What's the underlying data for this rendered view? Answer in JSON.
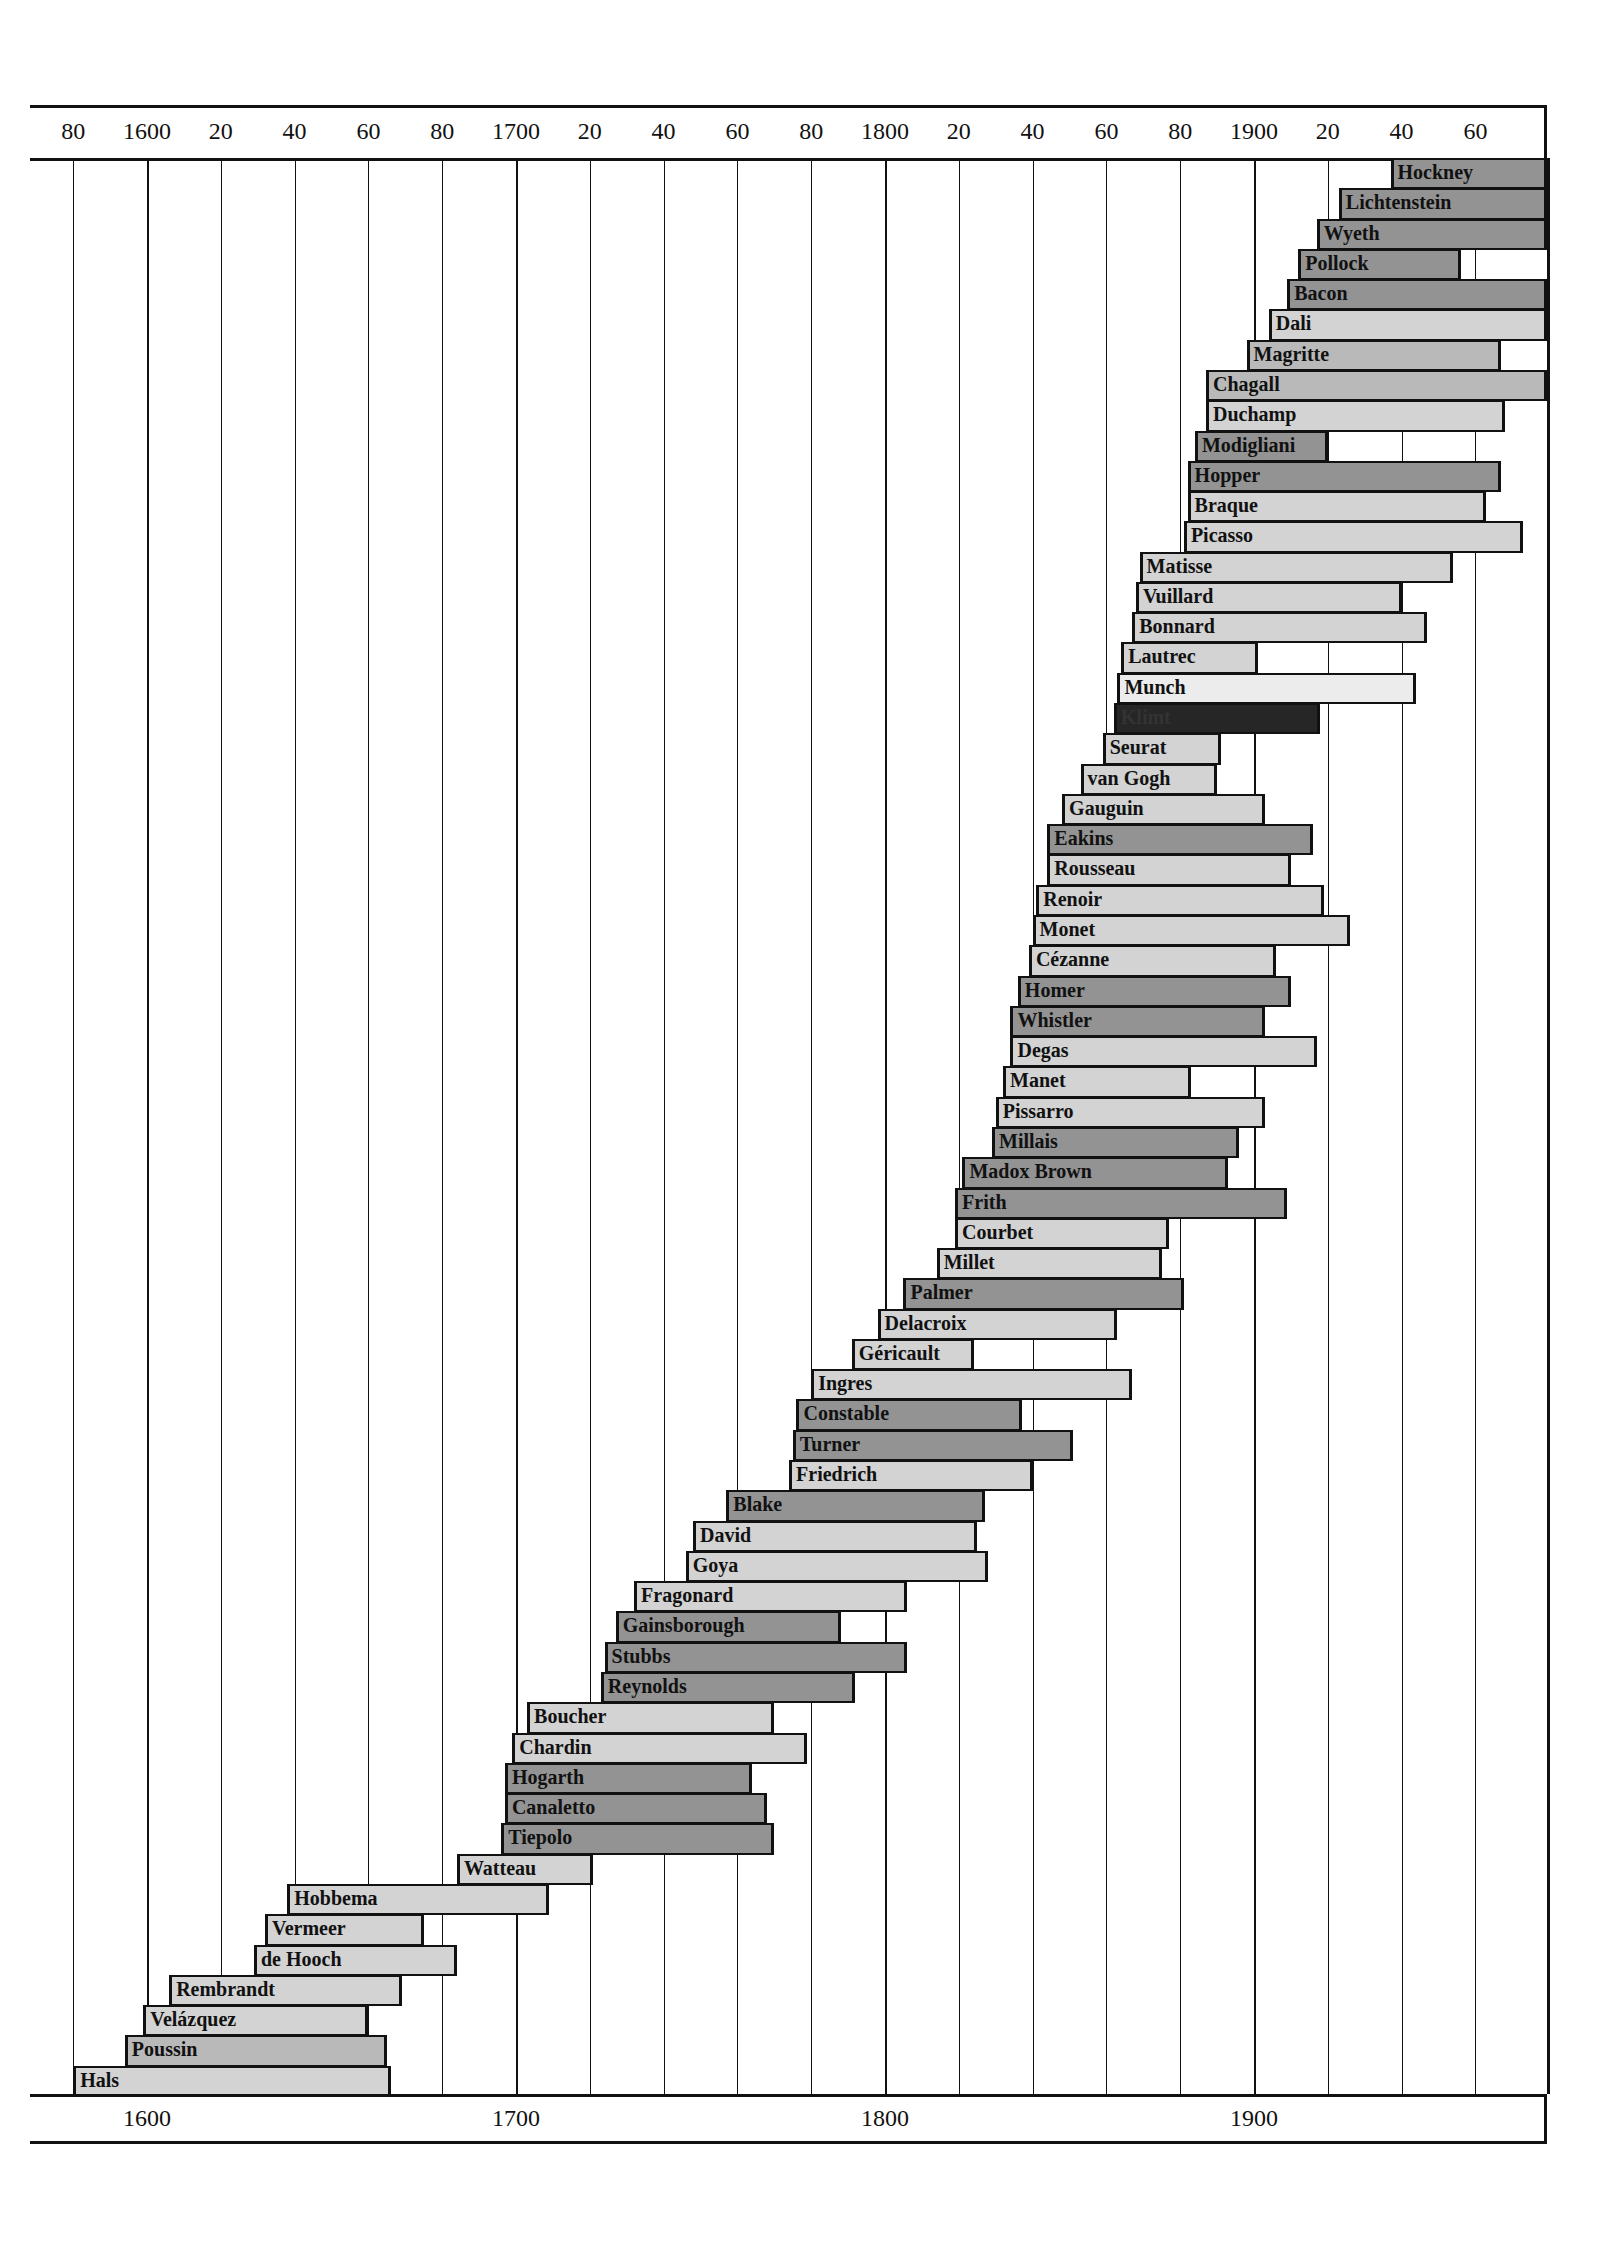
{
  "chart_data": {
    "type": "bar",
    "subtype": "timeline-gantt",
    "title": "",
    "xlabel": "Year",
    "ylabel": "",
    "xlim": [
      1568,
      1979
    ],
    "grid": true,
    "grid_interval_years": 20,
    "legend": null,
    "top_axis_ticks": [
      "80",
      "1600",
      "20",
      "40",
      "60",
      "80",
      "1700",
      "20",
      "40",
      "60",
      "80",
      "1800",
      "20",
      "40",
      "60",
      "80",
      "1900",
      "20",
      "40",
      "60"
    ],
    "top_axis_tick_years": [
      1580,
      1600,
      1620,
      1640,
      1660,
      1680,
      1700,
      1720,
      1740,
      1760,
      1780,
      1800,
      1820,
      1840,
      1860,
      1880,
      1900,
      1920,
      1940,
      1960
    ],
    "bottom_axis_ticks": [
      "1600",
      "1700",
      "1800",
      "1900"
    ],
    "bottom_axis_tick_years": [
      1600,
      1700,
      1800,
      1900
    ],
    "note": "Bars extending to right frame edge denote artists still living at publication.",
    "series": [
      {
        "name": "Hockney",
        "start": 1937,
        "end": null,
        "shade": "dark"
      },
      {
        "name": "Lichtenstein",
        "start": 1923,
        "end": null,
        "shade": "dark"
      },
      {
        "name": "Wyeth",
        "start": 1917,
        "end": null,
        "shade": "dark"
      },
      {
        "name": "Pollock",
        "start": 1912,
        "end": 1956,
        "shade": "dark"
      },
      {
        "name": "Bacon",
        "start": 1909,
        "end": null,
        "shade": "dark"
      },
      {
        "name": "Dali",
        "start": 1904,
        "end": null,
        "shade": "light"
      },
      {
        "name": "Magritte",
        "start": 1898,
        "end": 1967,
        "shade": "mid"
      },
      {
        "name": "Chagall",
        "start": 1887,
        "end": null,
        "shade": "mid"
      },
      {
        "name": "Duchamp",
        "start": 1887,
        "end": 1968,
        "shade": "light"
      },
      {
        "name": "Modigliani",
        "start": 1884,
        "end": 1920,
        "shade": "dark"
      },
      {
        "name": "Hopper",
        "start": 1882,
        "end": 1967,
        "shade": "dark"
      },
      {
        "name": "Braque",
        "start": 1882,
        "end": 1963,
        "shade": "light"
      },
      {
        "name": "Picasso",
        "start": 1881,
        "end": 1973,
        "shade": "light"
      },
      {
        "name": "Matisse",
        "start": 1869,
        "end": 1954,
        "shade": "light"
      },
      {
        "name": "Vuillard",
        "start": 1868,
        "end": 1940,
        "shade": "light"
      },
      {
        "name": "Bonnard",
        "start": 1867,
        "end": 1947,
        "shade": "light"
      },
      {
        "name": "Lautrec",
        "start": 1864,
        "end": 1901,
        "shade": "light"
      },
      {
        "name": "Munch",
        "start": 1863,
        "end": 1944,
        "shade": "vlight"
      },
      {
        "name": "Klimt",
        "start": 1862,
        "end": 1918,
        "shade": "black"
      },
      {
        "name": "Seurat",
        "start": 1859,
        "end": 1891,
        "shade": "light"
      },
      {
        "name": "van Gogh",
        "start": 1853,
        "end": 1890,
        "shade": "light"
      },
      {
        "name": "Gauguin",
        "start": 1848,
        "end": 1903,
        "shade": "light"
      },
      {
        "name": "Eakins",
        "start": 1844,
        "end": 1916,
        "shade": "dark"
      },
      {
        "name": "Rousseau",
        "start": 1844,
        "end": 1910,
        "shade": "light"
      },
      {
        "name": "Renoir",
        "start": 1841,
        "end": 1919,
        "shade": "light"
      },
      {
        "name": "Monet",
        "start": 1840,
        "end": 1926,
        "shade": "light"
      },
      {
        "name": "Cézanne",
        "start": 1839,
        "end": 1906,
        "shade": "light"
      },
      {
        "name": "Homer",
        "start": 1836,
        "end": 1910,
        "shade": "dark"
      },
      {
        "name": "Whistler",
        "start": 1834,
        "end": 1903,
        "shade": "dark"
      },
      {
        "name": "Degas",
        "start": 1834,
        "end": 1917,
        "shade": "light"
      },
      {
        "name": "Manet",
        "start": 1832,
        "end": 1883,
        "shade": "light"
      },
      {
        "name": "Pissarro",
        "start": 1830,
        "end": 1903,
        "shade": "light"
      },
      {
        "name": "Millais",
        "start": 1829,
        "end": 1896,
        "shade": "dark"
      },
      {
        "name": "Madox Brown",
        "start": 1821,
        "end": 1893,
        "shade": "dark"
      },
      {
        "name": "Frith",
        "start": 1819,
        "end": 1909,
        "shade": "dark"
      },
      {
        "name": "Courbet",
        "start": 1819,
        "end": 1877,
        "shade": "light"
      },
      {
        "name": "Millet",
        "start": 1814,
        "end": 1875,
        "shade": "light"
      },
      {
        "name": "Palmer",
        "start": 1805,
        "end": 1881,
        "shade": "dark"
      },
      {
        "name": "Delacroix",
        "start": 1798,
        "end": 1863,
        "shade": "light"
      },
      {
        "name": "Géricault",
        "start": 1791,
        "end": 1824,
        "shade": "light"
      },
      {
        "name": "Ingres",
        "start": 1780,
        "end": 1867,
        "shade": "light"
      },
      {
        "name": "Constable",
        "start": 1776,
        "end": 1837,
        "shade": "dark"
      },
      {
        "name": "Turner",
        "start": 1775,
        "end": 1851,
        "shade": "dark"
      },
      {
        "name": "Friedrich",
        "start": 1774,
        "end": 1840,
        "shade": "light"
      },
      {
        "name": "Blake",
        "start": 1757,
        "end": 1827,
        "shade": "dark"
      },
      {
        "name": "David",
        "start": 1748,
        "end": 1825,
        "shade": "light"
      },
      {
        "name": "Goya",
        "start": 1746,
        "end": 1828,
        "shade": "light"
      },
      {
        "name": "Fragonard",
        "start": 1732,
        "end": 1806,
        "shade": "light"
      },
      {
        "name": "Gainsborough",
        "start": 1727,
        "end": 1788,
        "shade": "dark"
      },
      {
        "name": "Stubbs",
        "start": 1724,
        "end": 1806,
        "shade": "dark"
      },
      {
        "name": "Reynolds",
        "start": 1723,
        "end": 1792,
        "shade": "dark"
      },
      {
        "name": "Boucher",
        "start": 1703,
        "end": 1770,
        "shade": "light"
      },
      {
        "name": "Chardin",
        "start": 1699,
        "end": 1779,
        "shade": "light"
      },
      {
        "name": "Hogarth",
        "start": 1697,
        "end": 1764,
        "shade": "dark"
      },
      {
        "name": "Canaletto",
        "start": 1697,
        "end": 1768,
        "shade": "dark"
      },
      {
        "name": "Tiepolo",
        "start": 1696,
        "end": 1770,
        "shade": "dark"
      },
      {
        "name": "Watteau",
        "start": 1684,
        "end": 1721,
        "shade": "light"
      },
      {
        "name": "Hobbema",
        "start": 1638,
        "end": 1709,
        "shade": "light"
      },
      {
        "name": "Vermeer",
        "start": 1632,
        "end": 1675,
        "shade": "light"
      },
      {
        "name": "de Hooch",
        "start": 1629,
        "end": 1684,
        "shade": "light"
      },
      {
        "name": "Rembrandt",
        "start": 1606,
        "end": 1669,
        "shade": "light"
      },
      {
        "name": "Velázquez",
        "start": 1599,
        "end": 1660,
        "shade": "light"
      },
      {
        "name": "Poussin",
        "start": 1594,
        "end": 1665,
        "shade": "mid"
      },
      {
        "name": "Hals",
        "start": 1580,
        "end": 1666,
        "shade": "light"
      }
    ]
  },
  "colors": {
    "vlight": "#ececec",
    "light": "#d3d3d3",
    "mid": "#b9b9b9",
    "dark": "#939393",
    "black": "#262626",
    "line": "#111111",
    "background": "#ffffff"
  }
}
